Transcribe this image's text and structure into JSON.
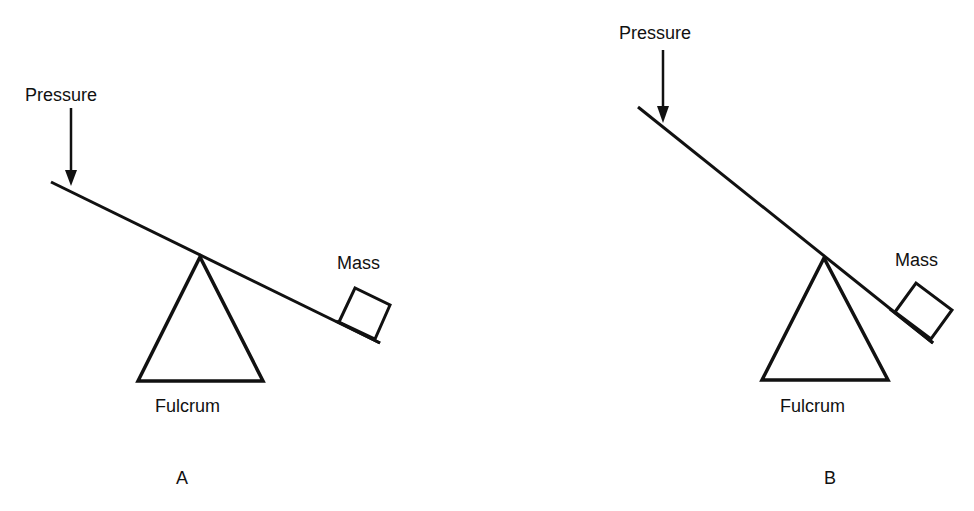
{
  "colors": {
    "ink": "#111111",
    "background": "#ffffff"
  },
  "panels": [
    {
      "id": "A",
      "caption": "A",
      "labels": {
        "force": "Pressure",
        "load": "Mass",
        "pivot": "Fulcrum"
      },
      "description": "Lever with fulcrum near the middle; shallow tilt"
    },
    {
      "id": "B",
      "caption": "B",
      "labels": {
        "force": "Pressure",
        "load": "Mass",
        "pivot": "Fulcrum"
      },
      "description": "Lever with fulcrum closer to the mass; steeper tilt"
    }
  ]
}
